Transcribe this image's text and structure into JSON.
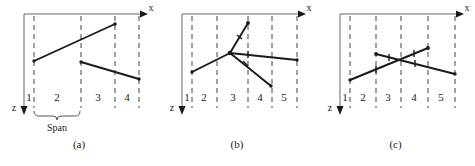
{
  "figure": {
    "axis_x_label": "x",
    "axis_z_label": "z",
    "span_label": "Span"
  },
  "panels": [
    {
      "caption": "(a)",
      "regions": [
        "1",
        "2",
        "3",
        "4"
      ],
      "axis_x_label": "x",
      "axis_z_label": "z",
      "span_label": "Span"
    },
    {
      "caption": "(b)",
      "regions": [
        "1",
        "2",
        "3",
        "4",
        "5"
      ],
      "axis_x_label": "x",
      "axis_z_label": "z"
    },
    {
      "caption": "(c)",
      "regions": [
        "1",
        "2",
        "3",
        "4",
        "5"
      ],
      "axis_x_label": "x",
      "axis_z_label": "z"
    }
  ],
  "colors": {
    "line": "#1a1a1a",
    "dashed": "#555555",
    "axis": "#666666",
    "background": "#ffffff"
  }
}
